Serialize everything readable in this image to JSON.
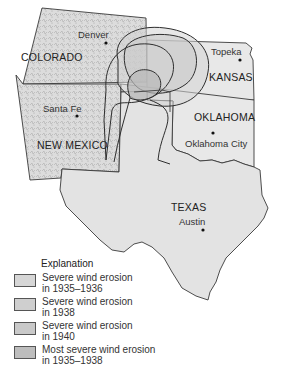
{
  "map": {
    "states": [
      {
        "name": "COLORADO",
        "x": 21,
        "y": 49
      },
      {
        "name": "KANSAS",
        "x": 209,
        "y": 72
      },
      {
        "name": "OKLAHOMA",
        "x": 194,
        "y": 110
      },
      {
        "name": "NEW MEXICO",
        "x": 37,
        "y": 138
      },
      {
        "name": "TEXAS",
        "x": 171,
        "y": 199
      }
    ],
    "cities": [
      {
        "name": "Denver",
        "x": 78,
        "y": 30,
        "dot_x": 106,
        "dot_y": 43
      },
      {
        "name": "Topeka",
        "x": 211,
        "y": 47,
        "dot_x": 240,
        "dot_y": 60
      },
      {
        "name": "Santa Fe",
        "x": 43,
        "y": 101,
        "dot_x": 77,
        "dot_y": 116
      },
      {
        "name": "Oklahoma City",
        "x": 185,
        "y": 138,
        "dot_x": 213,
        "dot_y": 133
      },
      {
        "name": "Austin",
        "x": 179,
        "y": 216,
        "dot_x": 203,
        "dot_y": 230
      }
    ]
  },
  "legend": {
    "title": "Explanation",
    "items": [
      {
        "label_line1": "Severe wind erosion",
        "label_line2": "in 1935–1936",
        "color": "#d6d6d6"
      },
      {
        "label_line1": "Severe wind erosion",
        "label_line2": "in 1938",
        "color": "#cfcfcf"
      },
      {
        "label_line1": "Severe wind erosion",
        "label_line2": "in 1940",
        "color": "#c9c9c9"
      },
      {
        "label_line1": "Most severe wind erosion",
        "label_line2": "in 1935–1938",
        "color": "#bdbdbd"
      }
    ]
  },
  "colors": {
    "land": "#e6e6e6",
    "terrain": "#c8c8c8",
    "border": "#3a3a3a",
    "erosion_light": "#d9d9d9",
    "erosion_mid": "#cccccc",
    "erosion_dark": "#bcbcbc"
  }
}
